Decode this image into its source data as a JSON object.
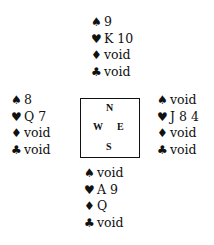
{
  "hands": {
    "north": {
      "spades": "9",
      "hearts": "K 10",
      "diamonds": "void",
      "clubs": "void"
    },
    "west": {
      "spades": "8",
      "hearts": "Q 7",
      "diamonds": "void",
      "clubs": "void"
    },
    "east": {
      "spades": "void",
      "hearts": "J 8 4",
      "diamonds": "void",
      "clubs": "void"
    },
    "south": {
      "spades": "void",
      "hearts": "A 9",
      "diamonds": "Q",
      "clubs": "void"
    }
  },
  "suits": {
    "spades": "♠",
    "hearts": "♥",
    "diamonds": "♦",
    "clubs": "♣"
  },
  "compass": {
    "n": "N",
    "w": "W",
    "e": "E",
    "s": "S"
  }
}
